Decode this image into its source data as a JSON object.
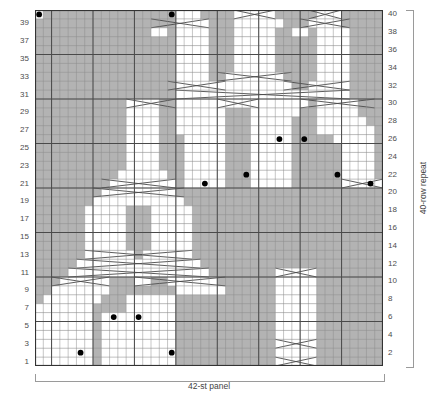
{
  "chart_data": {
    "type": "heatmap",
    "title": "",
    "xlabel": "42-st panel",
    "ylabel": "40-row repeat",
    "stitch_count": 42,
    "row_count": 40,
    "grid": true,
    "heavy_gridline_every": 5,
    "colors": {
      "background_cell": "#b3b3b3",
      "symbol_cell": "#ffffff",
      "gridline_light": "#8c8c8c",
      "gridline_heavy": "#4a4a4a",
      "border": "#333333",
      "dot": "#000000",
      "label_text": "#4d4d4d",
      "bracket": "#9a9a9a"
    },
    "left_tick_labels": [
      "39",
      "37",
      "35",
      "33",
      "31",
      "29",
      "27",
      "25",
      "23",
      "21",
      "19",
      "17",
      "15",
      "13",
      "11",
      "9",
      "7",
      "5",
      "3",
      "1"
    ],
    "right_tick_labels": [
      "40",
      "38",
      "36",
      "34",
      "32",
      "30",
      "28",
      "26",
      "24",
      "22",
      "20",
      "18",
      "16",
      "14",
      "12",
      "10",
      "8",
      "6",
      "4",
      "2"
    ],
    "legend": [],
    "annotations": [],
    "dots": [
      {
        "st": 2,
        "row": 21
      },
      {
        "st": 6,
        "row": 22
      },
      {
        "st": 10,
        "row": 26
      },
      {
        "st": 13,
        "row": 26
      },
      {
        "st": 17,
        "row": 22
      },
      {
        "st": 22,
        "row": 21
      },
      {
        "st": 26,
        "row": 40
      },
      {
        "st": 26,
        "row": 2
      },
      {
        "st": 30,
        "row": 6
      },
      {
        "st": 33,
        "row": 6
      },
      {
        "st": 37,
        "row": 2
      },
      {
        "st": 42,
        "row": 40
      }
    ],
    "white_cells": [
      {
        "row": 40,
        "runs": [
          [
            6,
            8
          ],
          [
            14,
            18
          ],
          [
            23,
            25
          ],
          [
            42,
            42
          ]
        ]
      },
      {
        "row": 39,
        "runs": [
          [
            6,
            9
          ],
          [
            13,
            18
          ],
          [
            22,
            25
          ]
        ]
      },
      {
        "row": 38,
        "runs": [
          [
            5,
            8
          ],
          [
            10,
            11
          ],
          [
            14,
            18
          ],
          [
            22,
            25
          ],
          [
            27,
            28
          ]
        ]
      },
      {
        "row": 37,
        "runs": [
          [
            5,
            8
          ],
          [
            14,
            18
          ],
          [
            22,
            25
          ]
        ]
      },
      {
        "row": 36,
        "runs": [
          [
            5,
            8
          ],
          [
            14,
            18
          ],
          [
            22,
            25
          ]
        ]
      },
      {
        "row": 35,
        "runs": [
          [
            5,
            8
          ],
          [
            14,
            18
          ],
          [
            22,
            25
          ]
        ]
      },
      {
        "row": 34,
        "runs": [
          [
            5,
            8
          ],
          [
            14,
            18
          ],
          [
            22,
            25
          ]
        ]
      },
      {
        "row": 33,
        "runs": [
          [
            5,
            8
          ],
          [
            13,
            19
          ],
          [
            22,
            25
          ]
        ]
      },
      {
        "row": 32,
        "runs": [
          [
            5,
            9
          ],
          [
            12,
            20
          ],
          [
            21,
            25
          ]
        ]
      },
      {
        "row": 31,
        "runs": [
          [
            5,
            25
          ]
        ]
      },
      {
        "row": 30,
        "runs": [
          [
            4,
            8
          ],
          [
            10,
            25
          ],
          [
            28,
            31
          ]
        ]
      },
      {
        "row": 29,
        "runs": [
          [
            4,
            8
          ],
          [
            11,
            16
          ],
          [
            20,
            25
          ],
          [
            28,
            31
          ]
        ]
      },
      {
        "row": 28,
        "runs": [
          [
            3,
            8
          ],
          [
            12,
            16
          ],
          [
            20,
            25
          ],
          [
            28,
            31
          ]
        ]
      },
      {
        "row": 27,
        "runs": [
          [
            2,
            8
          ],
          [
            12,
            16
          ],
          [
            20,
            25
          ],
          [
            28,
            31
          ]
        ]
      },
      {
        "row": 26,
        "runs": [
          [
            2,
            6
          ],
          [
            12,
            16
          ],
          [
            20,
            24
          ],
          [
            28,
            31
          ]
        ]
      },
      {
        "row": 25,
        "runs": [
          [
            2,
            5
          ],
          [
            12,
            16
          ],
          [
            20,
            24
          ],
          [
            28,
            31
          ]
        ]
      },
      {
        "row": 24,
        "runs": [
          [
            2,
            5
          ],
          [
            12,
            16
          ],
          [
            20,
            24
          ],
          [
            28,
            31
          ]
        ]
      },
      {
        "row": 23,
        "runs": [
          [
            2,
            5
          ],
          [
            12,
            16
          ],
          [
            20,
            24
          ],
          [
            28,
            31
          ]
        ]
      },
      {
        "row": 22,
        "runs": [
          [
            2,
            5
          ],
          [
            12,
            16
          ],
          [
            20,
            24
          ],
          [
            27,
            32
          ]
        ]
      },
      {
        "row": 21,
        "runs": [
          [
            1,
            5
          ],
          [
            12,
            16
          ],
          [
            20,
            24
          ],
          [
            26,
            33
          ]
        ]
      },
      {
        "row": 20,
        "runs": [
          [
            26,
            34
          ]
        ]
      },
      {
        "row": 19,
        "runs": [
          [
            25,
            35
          ]
        ]
      },
      {
        "row": 18,
        "runs": [
          [
            24,
            28
          ],
          [
            32,
            36
          ]
        ]
      },
      {
        "row": 17,
        "runs": [
          [
            24,
            28
          ],
          [
            32,
            36
          ]
        ]
      },
      {
        "row": 16,
        "runs": [
          [
            24,
            28
          ],
          [
            32,
            36
          ]
        ]
      },
      {
        "row": 15,
        "runs": [
          [
            24,
            28
          ],
          [
            32,
            36
          ]
        ]
      },
      {
        "row": 14,
        "runs": [
          [
            24,
            28
          ],
          [
            32,
            36
          ]
        ]
      },
      {
        "row": 13,
        "runs": [
          [
            24,
            29
          ],
          [
            31,
            36
          ]
        ]
      },
      {
        "row": 12,
        "runs": [
          [
            23,
            37
          ]
        ]
      },
      {
        "row": 11,
        "runs": [
          [
            9,
            13
          ],
          [
            22,
            38
          ]
        ]
      },
      {
        "row": 10,
        "runs": [
          [
            9,
            13
          ],
          [
            21,
            26
          ],
          [
            29,
            30
          ],
          [
            34,
            39
          ]
        ]
      },
      {
        "row": 9,
        "runs": [
          [
            9,
            13
          ],
          [
            20,
            25
          ],
          [
            34,
            40
          ]
        ]
      },
      {
        "row": 8,
        "runs": [
          [
            9,
            13
          ],
          [
            26,
            31
          ],
          [
            35,
            41
          ]
        ]
      },
      {
        "row": 7,
        "runs": [
          [
            9,
            13
          ],
          [
            26,
            31
          ],
          [
            36,
            42
          ]
        ]
      },
      {
        "row": 6,
        "runs": [
          [
            9,
            13
          ],
          [
            26,
            34
          ],
          [
            36,
            42
          ]
        ]
      },
      {
        "row": 5,
        "runs": [
          [
            9,
            13
          ],
          [
            26,
            34
          ],
          [
            36,
            42
          ]
        ]
      },
      {
        "row": 4,
        "runs": [
          [
            9,
            13
          ],
          [
            26,
            34
          ],
          [
            36,
            42
          ]
        ]
      },
      {
        "row": 3,
        "runs": [
          [
            9,
            13
          ],
          [
            26,
            34
          ],
          [
            36,
            42
          ]
        ]
      },
      {
        "row": 2,
        "runs": [
          [
            9,
            13
          ],
          [
            26,
            34
          ],
          [
            36,
            42
          ]
        ]
      },
      {
        "row": 1,
        "runs": [
          [
            9,
            13
          ],
          [
            26,
            34
          ],
          [
            36,
            42
          ]
        ]
      }
    ],
    "cable_strokes": [
      {
        "row": 40,
        "x1": 6,
        "x2": 9,
        "dir": "down"
      },
      {
        "row": 40,
        "x1": 14,
        "x2": 18,
        "dir": "x"
      },
      {
        "row": 39,
        "x1": 5,
        "x2": 10,
        "dir": "x"
      },
      {
        "row": 39,
        "x1": 22,
        "x2": 28,
        "dir": "x"
      },
      {
        "row": 33,
        "x1": 12,
        "x2": 20,
        "dir": "x"
      },
      {
        "row": 32,
        "x1": 5,
        "x2": 12,
        "dir": "x"
      },
      {
        "row": 32,
        "x1": 20,
        "x2": 26,
        "dir": "x"
      },
      {
        "row": 31,
        "x1": 5,
        "x2": 25,
        "dir": "x"
      },
      {
        "row": 30,
        "x1": 2,
        "x2": 10,
        "dir": "x"
      },
      {
        "row": 30,
        "x1": 16,
        "x2": 20,
        "dir": "x"
      },
      {
        "row": 30,
        "x1": 26,
        "x2": 31,
        "dir": "x"
      },
      {
        "row": 21,
        "x1": 1,
        "x2": 5,
        "dir": "x"
      },
      {
        "row": 21,
        "x1": 26,
        "x2": 34,
        "dir": "x"
      },
      {
        "row": 20,
        "x1": 25,
        "x2": 35,
        "dir": "x"
      },
      {
        "row": 13,
        "x1": 24,
        "x2": 36,
        "dir": "x"
      },
      {
        "row": 12,
        "x1": 23,
        "x2": 37,
        "dir": "x"
      },
      {
        "row": 11,
        "x1": 9,
        "x2": 13,
        "dir": "x"
      },
      {
        "row": 11,
        "x1": 22,
        "x2": 38,
        "dir": "x"
      },
      {
        "row": 10,
        "x1": 20,
        "x2": 30,
        "dir": "x"
      },
      {
        "row": 10,
        "x1": 34,
        "x2": 40,
        "dir": "x"
      },
      {
        "row": 3,
        "x1": 9,
        "x2": 13,
        "dir": "x"
      },
      {
        "row": 1,
        "x1": 9,
        "x2": 13,
        "dir": "x"
      }
    ]
  },
  "caption": {
    "bottom": "42-st panel",
    "right": "40-row repeat"
  }
}
